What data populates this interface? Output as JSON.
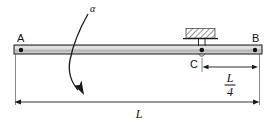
{
  "figure": {
    "labels": {
      "left_end": "A",
      "right_end": "B",
      "support_point": "C",
      "rotation": "α",
      "total_length": "L",
      "segment_numerator": "L",
      "segment_denominator": "4"
    },
    "colors": {
      "beam_fill": "#c9c9c9",
      "beam_highlight": "#e3e3e3",
      "beam_outline": "#1a1a1a",
      "pin_dot": "#111111",
      "hatch_stroke": "#3a3a3a",
      "dimension_line": "#1a1a1a",
      "background": "#ffffff"
    },
    "geometry": {
      "beam_left_x": 14,
      "beam_right_x": 262,
      "beam_top_y": 45,
      "beam_bottom_y": 54,
      "support_x": 202,
      "total_length_dim_y": 102,
      "segment_dim_y": 67
    },
    "icons": {
      "pin_support": "pin-dot",
      "fixed_ground": "hatched-ground",
      "rotation": "curved-arrow"
    }
  }
}
